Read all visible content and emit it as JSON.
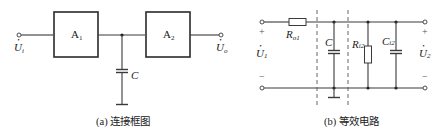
{
  "figure_a": {
    "caption": "(a) 连接框图",
    "block1": {
      "main": "A",
      "sub": "1"
    },
    "block2": {
      "main": "A",
      "sub": "2"
    },
    "capacitor_label": "C",
    "input_voltage": {
      "main": "U",
      "sub": "i",
      "dot": "•"
    },
    "output_voltage": {
      "main": "U",
      "sub": "o",
      "dot": "•"
    }
  },
  "figure_b": {
    "caption": "(b) 等效电路",
    "resistor_out": {
      "main": "R",
      "sub": "o1"
    },
    "capacitor_c": {
      "main": "C"
    },
    "resistor_in": {
      "main": "R",
      "sub": "i2"
    },
    "capacitor_in": {
      "main": "C",
      "sub": "i2"
    },
    "input_voltage": {
      "main": "U",
      "sub": "1",
      "dot": "•"
    },
    "output_voltage": {
      "main": "U",
      "sub": "2",
      "dot": "•"
    },
    "plus_sign": "+",
    "minus_sign": "−"
  }
}
